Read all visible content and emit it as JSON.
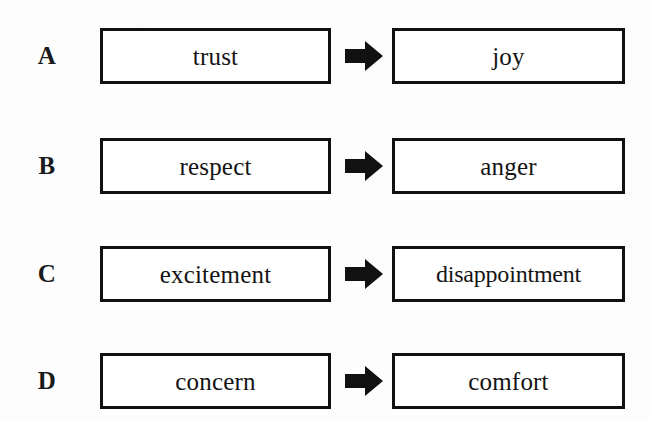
{
  "diagram": {
    "type": "paired-term-flow",
    "arrow_icon": "right-block-arrow-icon",
    "colors": {
      "background": "#fdfdfd",
      "box_border": "#111111",
      "box_fill": "#ffffff",
      "text": "#141414",
      "arrow_fill": "#111111"
    },
    "rows": [
      {
        "label": "A",
        "source": "trust",
        "target": "joy"
      },
      {
        "label": "B",
        "source": "respect",
        "target": "anger"
      },
      {
        "label": "C",
        "source": "excitement",
        "target": "disappointment"
      },
      {
        "label": "D",
        "source": "concern",
        "target": "comfort"
      }
    ]
  }
}
